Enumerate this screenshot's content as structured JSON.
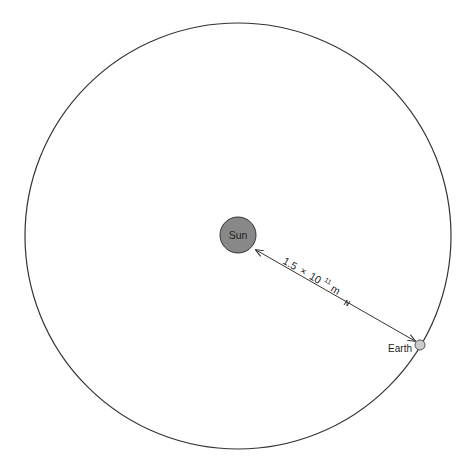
{
  "diagram": {
    "orbit": {
      "cx": 238,
      "cy": 236,
      "r": 213,
      "stroke": "#333333"
    },
    "sun": {
      "label": "Sun",
      "cx": 238,
      "cy": 235,
      "r": 18,
      "fill": "#888888",
      "stroke": "#333333"
    },
    "earth": {
      "label": "Earth",
      "cx": 420,
      "cy": 345,
      "r": 5,
      "fill": "#cccccc",
      "stroke": "#555555"
    },
    "distance": {
      "mantissa": "1.5",
      "times": "×",
      "base": "10",
      "exponent": "11",
      "unit": "m",
      "full_text": "1.5 × 10¹¹m"
    },
    "arrow": {
      "x1": 256,
      "y1": 250,
      "x2": 415,
      "y2": 341,
      "style": "double-headed with break mark"
    }
  }
}
